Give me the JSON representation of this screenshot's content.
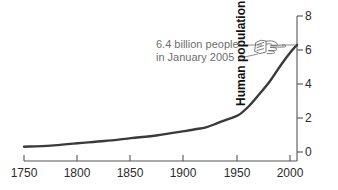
{
  "chart_data": {
    "type": "line",
    "title": "",
    "xlabel": "",
    "ylabel": "Human population size (in billions)",
    "xlim": [
      1750,
      2005
    ],
    "ylim": [
      0,
      8
    ],
    "grid": false,
    "legend": "none",
    "xticks": [
      1750,
      1800,
      1850,
      1900,
      1950,
      2000
    ],
    "xtick_labels": [
      "1750",
      "1800",
      "1850",
      "1900",
      "1950",
      "2000"
    ],
    "yticks": [
      0,
      2,
      4,
      6,
      8
    ],
    "ytick_labels": [
      "0",
      "2",
      "4",
      "6",
      "8"
    ],
    "series": [
      {
        "name": "Human population",
        "color": "#3a3a3a",
        "x": [
          1750,
          1775,
          1800,
          1825,
          1850,
          1875,
          1900,
          1910,
          1920,
          1930,
          1940,
          1950,
          1960,
          1970,
          1980,
          1990,
          2000,
          2005
        ],
        "values": [
          0.79,
          0.85,
          0.98,
          1.1,
          1.26,
          1.42,
          1.65,
          1.75,
          1.86,
          2.07,
          2.3,
          2.52,
          3.02,
          3.7,
          4.43,
          5.3,
          6.08,
          6.4
        ]
      }
    ],
    "annotations": [
      {
        "text_lines": [
          "6.4 billion people",
          "in January 2005"
        ],
        "value": 6.4,
        "year": 2005,
        "color": "#6e6e6e",
        "icon": "pointing-hand-icon"
      }
    ]
  },
  "axes": {
    "x_tick_labels": [
      "1750",
      "1800",
      "1850",
      "1900",
      "1950",
      "2000"
    ],
    "y_tick_labels": [
      "0",
      "2",
      "4",
      "6",
      "8"
    ],
    "y_axis_title": "Human population size (in billions)"
  },
  "annotation": {
    "line1": "6.4 billion people",
    "line2": "in January 2005"
  },
  "colors": {
    "curve": "#3a3a3a",
    "axis": "#555555",
    "annotation_text": "#6e6e6e",
    "tick_text": "#2b2b2b",
    "background": "#ffffff"
  }
}
